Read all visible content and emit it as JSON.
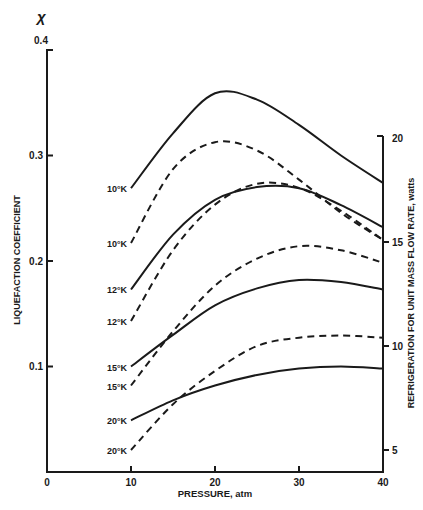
{
  "chart_data": {
    "type": "line",
    "title": "",
    "xlabel": "PRESSURE, atm",
    "ylabel": "LIQUEFACTION COEFFICIENT",
    "ylabel_symbol": "χ",
    "y2label": "REFRIGERATION FOR UNIT MASS FLOW RATE, watts",
    "xlim": [
      0,
      40
    ],
    "ylim": [
      0,
      0.4
    ],
    "y2lim": [
      4,
      20
    ],
    "x_ticks": [
      "0",
      "10",
      "20",
      "30",
      "40"
    ],
    "y_ticks": [
      "0.1",
      "0.2",
      "0.3",
      "0.4"
    ],
    "y2_ticks": [
      "5",
      "10",
      "15",
      "20"
    ],
    "grid": false,
    "legend": "inline labels at curve starts (P = 10 atm)",
    "x": [
      10,
      15,
      20,
      25,
      30,
      35,
      40
    ],
    "series": [
      {
        "name": "10°K",
        "axis": "left",
        "style": "solid",
        "quantity": "liquefaction coefficient",
        "values": [
          0.269,
          0.321,
          0.359,
          0.353,
          0.329,
          0.3,
          0.274
        ]
      },
      {
        "name": "10°K",
        "axis": "right",
        "style": "dashed",
        "quantity": "refrigeration, watts",
        "values": [
          14.95,
          18.5,
          19.8,
          19.4,
          18.0,
          16.4,
          15.1
        ]
      },
      {
        "name": "12°K",
        "axis": "left",
        "style": "solid",
        "quantity": "liquefaction coefficient",
        "values": [
          0.173,
          0.225,
          0.258,
          0.27,
          0.269,
          0.253,
          0.232
        ]
      },
      {
        "name": "12°K",
        "axis": "right",
        "style": "dashed",
        "quantity": "refrigeration, watts",
        "values": [
          11.2,
          14.6,
          16.8,
          17.8,
          17.6,
          16.5,
          15.1
        ]
      },
      {
        "name": "15°K",
        "axis": "left",
        "style": "solid",
        "quantity": "liquefaction coefficient",
        "values": [
          0.1,
          0.13,
          0.158,
          0.174,
          0.182,
          0.18,
          0.173
        ]
      },
      {
        "name": "15°K",
        "axis": "right",
        "style": "dashed",
        "quantity": "refrigeration, watts",
        "values": [
          8.1,
          10.7,
          12.9,
          14.2,
          14.8,
          14.6,
          14.0
        ]
      },
      {
        "name": "20°K",
        "axis": "left",
        "style": "solid",
        "quantity": "liquefaction coefficient",
        "values": [
          0.049,
          0.068,
          0.082,
          0.092,
          0.098,
          0.1,
          0.098
        ]
      },
      {
        "name": "20°K",
        "axis": "right",
        "style": "dashed",
        "quantity": "refrigeration, watts",
        "values": [
          5.0,
          7.2,
          8.8,
          10.0,
          10.4,
          10.5,
          10.4
        ]
      }
    ]
  },
  "labels": {
    "chi": "χ",
    "ylabel": "LIQUEFACTION COEFFICIENT",
    "xlabel": "PRESSURE, atm",
    "y2label": "REFRIGERATION FOR UNIT MASS FLOW RATE, watts",
    "curve_labels": [
      "10°K",
      "10°K",
      "12°K",
      "12°K",
      "15°K",
      "15°K",
      "20°K",
      "20°K"
    ]
  },
  "colors": {
    "ink": "#1a1a1a",
    "background": "#ffffff"
  }
}
